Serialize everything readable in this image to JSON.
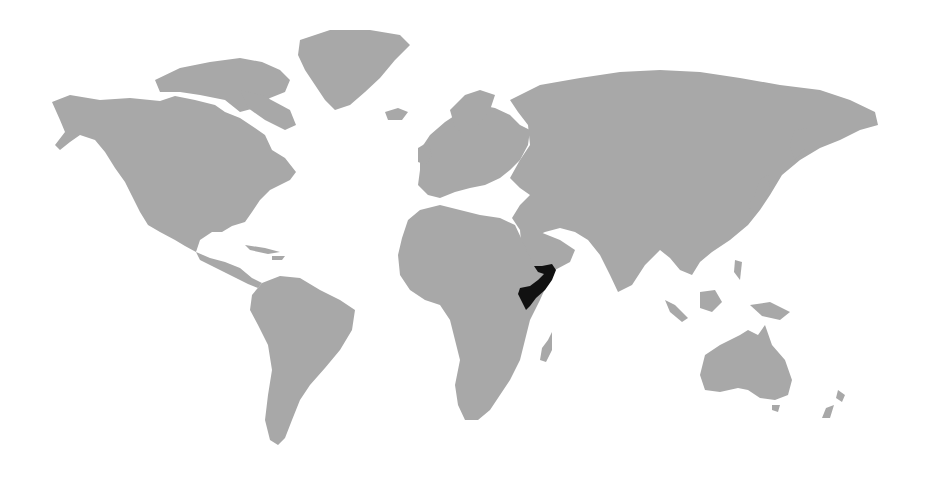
{
  "map": {
    "type": "world-locator-map",
    "highlighted_region": "Somalia",
    "colors": {
      "land": "#a8a8a8",
      "highlight": "#111111",
      "water": "#ffffff"
    }
  }
}
